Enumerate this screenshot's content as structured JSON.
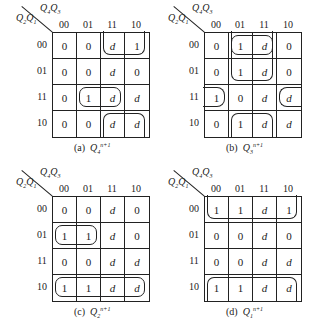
{
  "figure": {
    "row_var": "Q2Q1",
    "col_var": "Q4Q3",
    "col_labels": [
      "00",
      "01",
      "11",
      "10"
    ],
    "row_labels": [
      "00",
      "01",
      "11",
      "10"
    ]
  },
  "maps": [
    {
      "label": "(a)",
      "func": "Q",
      "sub": "4",
      "sup": "n+1",
      "cells": [
        [
          "0",
          "0",
          "d",
          "1"
        ],
        [
          "0",
          "0",
          "d",
          "0"
        ],
        [
          "0",
          "1",
          "d",
          "d"
        ],
        [
          "0",
          "0",
          "d",
          "d"
        ]
      ],
      "loops": [
        {
          "r": 0,
          "c": 2,
          "h": 1,
          "w": 2,
          "open": "top"
        },
        {
          "r": 2,
          "c": 1,
          "h": 1,
          "w": 2,
          "open": "none"
        },
        {
          "r": 3,
          "c": 2,
          "h": 1,
          "w": 2,
          "open": "bottom"
        }
      ]
    },
    {
      "label": "(b)",
      "func": "Q",
      "sub": "3",
      "sup": "n+1",
      "cells": [
        [
          "0",
          "1",
          "d",
          "0"
        ],
        [
          "0",
          "1",
          "d",
          "0"
        ],
        [
          "1",
          "0",
          "d",
          "d"
        ],
        [
          "0",
          "1",
          "d",
          "d"
        ]
      ],
      "loops": [
        {
          "r": 0,
          "c": 1,
          "h": 1,
          "w": 2,
          "open": "none"
        },
        {
          "r": 0,
          "c": 1,
          "h": 2,
          "w": 2,
          "open": "top"
        },
        {
          "r": 2,
          "c": 0,
          "h": 1,
          "w": 1,
          "open": "left"
        },
        {
          "r": 2,
          "c": 3,
          "h": 1,
          "w": 1,
          "open": "right"
        },
        {
          "r": 3,
          "c": 1,
          "h": 1,
          "w": 2,
          "open": "bottom"
        }
      ]
    },
    {
      "label": "(c)",
      "func": "Q",
      "sub": "2",
      "sup": "n+1",
      "cells": [
        [
          "0",
          "0",
          "d",
          "0"
        ],
        [
          "1",
          "1",
          "d",
          "0"
        ],
        [
          "0",
          "0",
          "d",
          "d"
        ],
        [
          "1",
          "1",
          "d",
          "d"
        ]
      ],
      "loops": [
        {
          "r": 1,
          "c": 0,
          "h": 1,
          "w": 2,
          "open": "none"
        },
        {
          "r": 3,
          "c": 0,
          "h": 1,
          "w": 4,
          "open": "none"
        }
      ]
    },
    {
      "label": "(d)",
      "func": "Q",
      "sub": "1",
      "sup": "n+1",
      "cells": [
        [
          "1",
          "1",
          "d",
          "1"
        ],
        [
          "0",
          "0",
          "d",
          "0"
        ],
        [
          "0",
          "0",
          "d",
          "d"
        ],
        [
          "1",
          "1",
          "d",
          "d"
        ]
      ],
      "loops": [
        {
          "r": 0,
          "c": 0,
          "h": 1,
          "w": 4,
          "open": "top"
        },
        {
          "r": 3,
          "c": 0,
          "h": 1,
          "w": 4,
          "open": "bottom"
        }
      ]
    }
  ]
}
